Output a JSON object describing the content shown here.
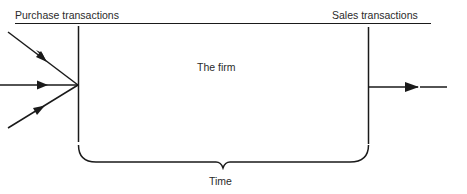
{
  "diagram": {
    "labels": {
      "purchase": "Purchase transactions",
      "sales": "Sales transactions",
      "firm": "The firm",
      "time": "Time"
    },
    "inputs": [
      {
        "name": "purchase-arrow-top"
      },
      {
        "name": "purchase-arrow-middle"
      },
      {
        "name": "purchase-arrow-bottom"
      }
    ],
    "outputs": [
      {
        "name": "sales-arrow"
      }
    ],
    "colors": {
      "line": "#1a1a1a",
      "text": "#2a2a2a",
      "background": "#ffffff"
    }
  }
}
